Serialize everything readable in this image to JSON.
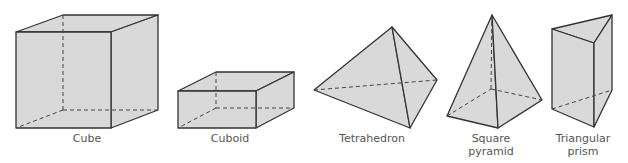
{
  "figure": {
    "shapes": [
      {
        "id": "cube",
        "label": [
          "Cube"
        ]
      },
      {
        "id": "cuboid",
        "label": [
          "Cuboid"
        ]
      },
      {
        "id": "tetrahedron",
        "label": [
          "Tetrahedron"
        ]
      },
      {
        "id": "square-pyramid",
        "label": [
          "Square",
          "pyramid"
        ]
      },
      {
        "id": "triangular-prism",
        "label": [
          "Triangular",
          "prism"
        ]
      }
    ],
    "colors": {
      "fill": "#d9d9d9",
      "stroke": "#333333",
      "label": "#555555"
    }
  }
}
